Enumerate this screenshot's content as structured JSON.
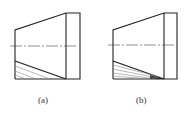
{
  "figures": [
    {
      "id": "a",
      "label": "(a)",
      "left_x": 15,
      "top_left_y": 30,
      "bottom_left_y": 79,
      "step_x": 66,
      "right_x": 80,
      "top_y": 13,
      "bottom_y": 79,
      "slant_bottom_start_y": 61,
      "center_y": 46,
      "center_x0": 10,
      "center_x1": 78,
      "wedge": false
    },
    {
      "id": "b",
      "label": "(b)",
      "left_x": 113,
      "top_left_y": 30,
      "bottom_left_y": 79,
      "step_x": 164,
      "right_x": 177,
      "top_y": 13,
      "bottom_y": 79,
      "slant_bottom_start_y": 61,
      "center_y": 45,
      "center_x0": 108,
      "center_x1": 175,
      "wedge": true
    }
  ],
  "colors": {
    "line": "#222222",
    "hatch": "#888888",
    "centerline": "#444444"
  }
}
